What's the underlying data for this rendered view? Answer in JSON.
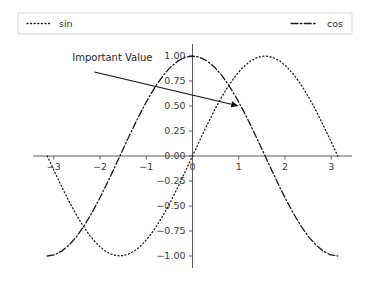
{
  "chart_data": {
    "type": "line",
    "title": "",
    "xlabel": "",
    "ylabel": "",
    "xlim": [
      -3.45,
      3.45
    ],
    "ylim": [
      -1.12,
      1.12
    ],
    "grid": false,
    "legend_position": "upper-center-wide",
    "xticks": [
      -3,
      -2,
      -1,
      0,
      1,
      2,
      3
    ],
    "xtick_labels": [
      "−3",
      "−2",
      "−1",
      "0",
      "1",
      "2",
      "3"
    ],
    "yticks": [
      -1.0,
      -0.75,
      -0.5,
      -0.25,
      0.0,
      0.25,
      0.5,
      0.75,
      1.0
    ],
    "ytick_labels": [
      "−1.00",
      "−0.75",
      "−0.50",
      "−0.25",
      "0.00",
      "0.25",
      "0.50",
      "0.75",
      "1.00"
    ],
    "series": [
      {
        "name": "sin",
        "style": "dotted",
        "color": "#1a1a1a",
        "x": [
          -3.1416,
          -2.9845,
          -2.8274,
          -2.6704,
          -2.5133,
          -2.3562,
          -2.1991,
          -2.042,
          -1.885,
          -1.7279,
          -1.5708,
          -1.4137,
          -1.2566,
          -1.0996,
          -0.9425,
          -0.7854,
          -0.6283,
          -0.4712,
          -0.3142,
          -0.1571,
          0.0,
          0.1571,
          0.3142,
          0.4712,
          0.6283,
          0.7854,
          0.9425,
          1.0996,
          1.2566,
          1.4137,
          1.5708,
          1.7279,
          1.885,
          2.042,
          2.1991,
          2.3562,
          2.5133,
          2.6704,
          2.8274,
          2.9845,
          3.1416
        ],
        "y": [
          0.0,
          -0.1564,
          -0.309,
          -0.454,
          -0.5878,
          -0.7071,
          -0.809,
          -0.891,
          -0.9511,
          -0.9877,
          -1.0,
          -0.9877,
          -0.9511,
          -0.891,
          -0.809,
          -0.7071,
          -0.5878,
          -0.454,
          -0.309,
          -0.1564,
          0.0,
          0.1564,
          0.309,
          0.454,
          0.5878,
          0.7071,
          0.809,
          0.891,
          0.9511,
          0.9877,
          1.0,
          0.9877,
          0.9511,
          0.891,
          0.809,
          0.7071,
          0.5878,
          0.454,
          0.309,
          0.1564,
          0.0
        ]
      },
      {
        "name": "cos",
        "style": "dash-dot",
        "color": "#1a1a1a",
        "x": [
          -3.1416,
          -2.9845,
          -2.8274,
          -2.6704,
          -2.5133,
          -2.3562,
          -2.1991,
          -2.042,
          -1.885,
          -1.7279,
          -1.5708,
          -1.4137,
          -1.2566,
          -1.0996,
          -0.9425,
          -0.7854,
          -0.6283,
          -0.4712,
          -0.3142,
          -0.1571,
          0.0,
          0.1571,
          0.3142,
          0.4712,
          0.6283,
          0.7854,
          0.9425,
          1.0996,
          1.2566,
          1.4137,
          1.5708,
          1.7279,
          1.885,
          2.042,
          2.1991,
          2.3562,
          2.5133,
          2.6704,
          2.8274,
          2.9845,
          3.1416
        ],
        "y": [
          -1.0,
          -0.9877,
          -0.9511,
          -0.891,
          -0.809,
          -0.7071,
          -0.5878,
          -0.454,
          -0.309,
          -0.1564,
          0.0,
          0.1564,
          0.309,
          0.454,
          0.5878,
          0.7071,
          0.809,
          0.891,
          0.9511,
          0.9877,
          1.0,
          0.9877,
          0.9511,
          0.891,
          0.809,
          0.7071,
          0.5878,
          0.454,
          0.309,
          0.1564,
          0.0,
          -0.1564,
          -0.309,
          -0.454,
          -0.5878,
          -0.7071,
          -0.809,
          -0.891,
          -0.9511,
          -0.9877,
          -1.0
        ]
      }
    ],
    "annotations": [
      {
        "text": "Important Value",
        "point_x": 1.0,
        "point_y": 0.5,
        "text_x": -2.6,
        "text_y": 0.95
      }
    ],
    "legend_entries": [
      {
        "label": "sin",
        "style": "dotted"
      },
      {
        "label": "cos",
        "style": "dash-dot"
      }
    ]
  }
}
